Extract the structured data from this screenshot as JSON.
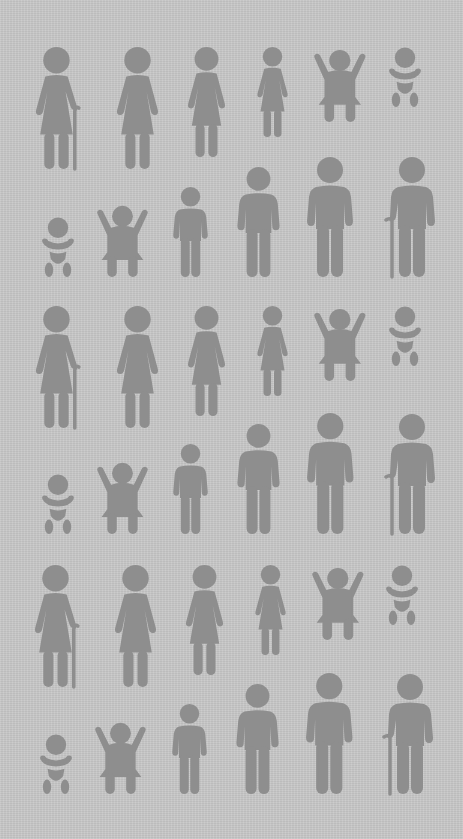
{
  "colors": {
    "background": "#c8c8c8",
    "figure": "#8e8e8e"
  },
  "legend": {
    "female_row": [
      "elderly woman with cane",
      "woman",
      "girl",
      "small girl",
      "toddler",
      "baby"
    ],
    "male_row": [
      "baby",
      "toddler",
      "boy",
      "teen boy",
      "man",
      "elderly man with cane"
    ]
  },
  "rows": [
    {
      "type": "female",
      "figures": [
        {
          "kind": "elderly-woman",
          "x": 58,
          "top": 47,
          "h": 122
        },
        {
          "kind": "woman",
          "x": 137,
          "top": 47,
          "h": 122
        },
        {
          "kind": "girl",
          "x": 206,
          "top": 47,
          "h": 110
        },
        {
          "kind": "small-girl",
          "x": 272,
          "top": 47,
          "h": 90
        },
        {
          "kind": "toddler",
          "x": 340,
          "top": 47,
          "h": 75
        },
        {
          "kind": "baby",
          "x": 405,
          "top": 47,
          "h": 60
        }
      ]
    },
    {
      "type": "male",
      "figures": [
        {
          "kind": "baby",
          "x": 58,
          "top": 217,
          "h": 60
        },
        {
          "kind": "toddler",
          "x": 122,
          "top": 203,
          "h": 74
        },
        {
          "kind": "boy",
          "x": 190,
          "top": 187,
          "h": 90
        },
        {
          "kind": "teen",
          "x": 258,
          "top": 167,
          "h": 110
        },
        {
          "kind": "man",
          "x": 330,
          "top": 157,
          "h": 120
        },
        {
          "kind": "elderly-man",
          "x": 410,
          "top": 157,
          "h": 120
        }
      ]
    },
    {
      "type": "female",
      "figures": [
        {
          "kind": "elderly-woman",
          "x": 58,
          "top": 306,
          "h": 122
        },
        {
          "kind": "woman",
          "x": 137,
          "top": 306,
          "h": 122
        },
        {
          "kind": "girl",
          "x": 206,
          "top": 306,
          "h": 110
        },
        {
          "kind": "small-girl",
          "x": 272,
          "top": 306,
          "h": 90
        },
        {
          "kind": "toddler",
          "x": 340,
          "top": 306,
          "h": 75
        },
        {
          "kind": "baby",
          "x": 405,
          "top": 306,
          "h": 60
        }
      ]
    },
    {
      "type": "male",
      "figures": [
        {
          "kind": "baby",
          "x": 58,
          "top": 474,
          "h": 60
        },
        {
          "kind": "toddler",
          "x": 122,
          "top": 460,
          "h": 74
        },
        {
          "kind": "boy",
          "x": 190,
          "top": 444,
          "h": 90
        },
        {
          "kind": "teen",
          "x": 258,
          "top": 424,
          "h": 110
        },
        {
          "kind": "man",
          "x": 330,
          "top": 413,
          "h": 121
        },
        {
          "kind": "elderly-man",
          "x": 410,
          "top": 414,
          "h": 120
        }
      ]
    },
    {
      "type": "female",
      "figures": [
        {
          "kind": "elderly-woman",
          "x": 57,
          "top": 565,
          "h": 122
        },
        {
          "kind": "woman",
          "x": 135,
          "top": 565,
          "h": 122
        },
        {
          "kind": "girl",
          "x": 204,
          "top": 565,
          "h": 110
        },
        {
          "kind": "small-girl",
          "x": 270,
          "top": 565,
          "h": 90
        },
        {
          "kind": "toddler",
          "x": 338,
          "top": 565,
          "h": 75
        },
        {
          "kind": "baby",
          "x": 402,
          "top": 565,
          "h": 60
        }
      ]
    },
    {
      "type": "male",
      "figures": [
        {
          "kind": "baby",
          "x": 56,
          "top": 734,
          "h": 60
        },
        {
          "kind": "toddler",
          "x": 120,
          "top": 720,
          "h": 74
        },
        {
          "kind": "boy",
          "x": 189,
          "top": 704,
          "h": 90
        },
        {
          "kind": "teen",
          "x": 257,
          "top": 684,
          "h": 110
        },
        {
          "kind": "man",
          "x": 329,
          "top": 673,
          "h": 121
        },
        {
          "kind": "elderly-man",
          "x": 408,
          "top": 674,
          "h": 120
        }
      ]
    }
  ]
}
